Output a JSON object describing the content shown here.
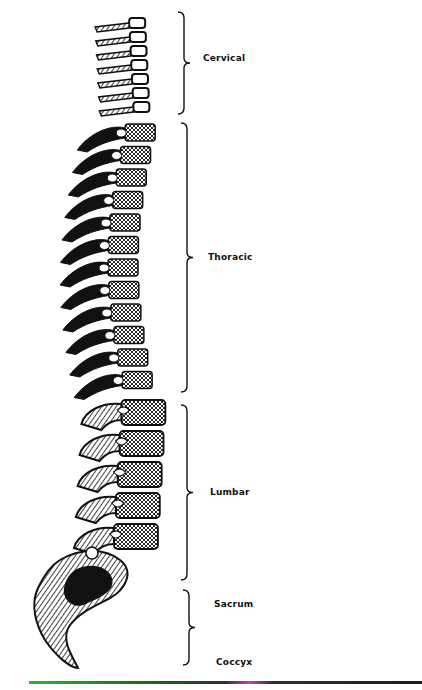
{
  "figure": {
    "regions": [
      {
        "key": "cervical",
        "label": "Cervical"
      },
      {
        "key": "thoracic",
        "label": "Thoracic"
      },
      {
        "key": "lumbar",
        "label": "Lumbar"
      },
      {
        "key": "sacrum",
        "label": "Sacrum"
      },
      {
        "key": "coccyx",
        "label": "Coccyx"
      }
    ],
    "colors": {
      "ink": "#111111",
      "background": "#ffffff",
      "baseline_left": "#2db52d",
      "baseline_mid": "#c040c0",
      "baseline_right": "#1c1c1c"
    }
  }
}
